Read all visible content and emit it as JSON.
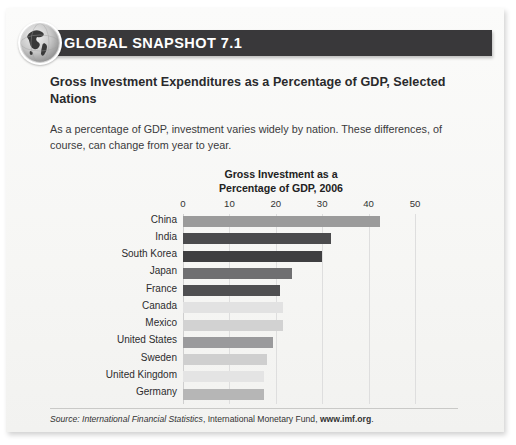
{
  "header": {
    "badge_icon": "globe-icon",
    "title": "GLOBAL SNAPSHOT 7.1",
    "bar_color": "#39383a"
  },
  "box": {
    "title": "Gross Investment Expenditures as a Percentage of GDP, Selected Nations",
    "description": "As a percentage of GDP, investment varies widely by nation. These differences, of course, can change from year to year."
  },
  "source": {
    "prefix": "Source: ",
    "publication": "International Financial Statistics",
    "middle": ", International Monetary Fund, ",
    "url": "www.imf.org",
    "suffix": "."
  },
  "chart_data": {
    "type": "bar",
    "orientation": "horizontal",
    "title": "Gross Investment as a Percentage of GDP, 2006",
    "title_line1": "Gross Investment as a",
    "title_line2": "Percentage of GDP, 2006",
    "xlabel": "",
    "ylabel": "",
    "xlim": [
      0,
      50
    ],
    "xticks": [
      0,
      10,
      20,
      30,
      40,
      50
    ],
    "xtick_labels": [
      "0",
      "10",
      "20",
      "30",
      "40",
      "50"
    ],
    "grid": true,
    "legend": "none",
    "categories": [
      "China",
      "India",
      "South Korea",
      "Japan",
      "France",
      "Canada",
      "Mexico",
      "United States",
      "Sweden",
      "United Kingdom",
      "Germany"
    ],
    "values": [
      42.5,
      32.0,
      30.0,
      23.5,
      21.0,
      21.5,
      21.5,
      19.5,
      18.0,
      17.5,
      17.5
    ],
    "bar_colors": [
      "#9b9b9b",
      "#4b4b4d",
      "#3f3f41",
      "#6f6f71",
      "#4f4f51",
      "#e2e2e2",
      "#d2d2d2",
      "#9a9a9c",
      "#cfcfcf",
      "#e4e4e4",
      "#b6b6b6"
    ]
  }
}
